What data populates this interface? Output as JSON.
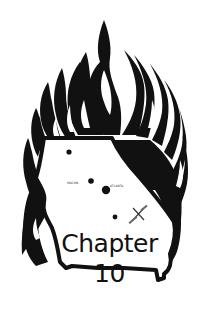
{
  "logo": {
    "title_line1": "Chapter",
    "title_line2": "10",
    "colors": {
      "ink": "#111111",
      "background": "#ffffff"
    },
    "map": {
      "state": "Georgia",
      "city_labels": [
        "MACON",
        "ATLANTA"
      ]
    }
  }
}
